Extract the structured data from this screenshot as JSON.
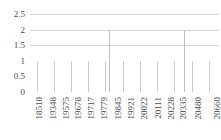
{
  "chart_data": {
    "type": "bar",
    "title": "",
    "subtitle": "",
    "xlabel": "",
    "ylabel": "",
    "ylim": [
      0,
      2.5
    ],
    "grid": true,
    "legend": null,
    "y_ticks": [
      "0",
      "0.5",
      "1",
      "1.5",
      "2",
      "2.5"
    ],
    "y_tick_values": [
      0,
      0.5,
      1,
      1.5,
      2,
      2.5
    ],
    "x_tick_labels": [
      "18510",
      "19348",
      "19575",
      "19678",
      "19717",
      "19779",
      "19845",
      "19921",
      "20022",
      "20111",
      "20228",
      "20335",
      "20480",
      "20660"
    ],
    "x_tick_indices": [
      0,
      7,
      13,
      19,
      25,
      31,
      38,
      44,
      50,
      57,
      63,
      69,
      76,
      85
    ],
    "categories": [
      "18510",
      "18562",
      "18643",
      "18710",
      "18788",
      "18851",
      "18920",
      "19348",
      "19389",
      "19421",
      "19468",
      "19503",
      "19540",
      "19575",
      "19601",
      "19622",
      "19640",
      "19659",
      "19678",
      "19690",
      "19698",
      "19703",
      "19709",
      "19713",
      "19717",
      "19726",
      "19738",
      "19749",
      "19760",
      "19770",
      "19779",
      "19790",
      "19802",
      "19815",
      "19828",
      "19838",
      "19845",
      "19858",
      "19872",
      "19886",
      "19899",
      "19910",
      "19921",
      "19936",
      "19952",
      "19968",
      "19984",
      "20000",
      "20022",
      "20038",
      "20055",
      "20072",
      "20089",
      "20100",
      "20111",
      "20128",
      "20146",
      "20164",
      "20182",
      "20200",
      "20228",
      "20246",
      "20264",
      "20282",
      "20300",
      "20318",
      "20335",
      "20355",
      "20375",
      "20395",
      "20415",
      "20435",
      "20480",
      "20500",
      "20520",
      "20540",
      "20560",
      "20580",
      "20600",
      "20615",
      "20630",
      "20645",
      "20660",
      "20672",
      "20684",
      "20696",
      "20708",
      "20718",
      "20728",
      "20738"
    ],
    "values": [
      1,
      1,
      1,
      1,
      1,
      1,
      1,
      1,
      1,
      1,
      1,
      1,
      1,
      1,
      1,
      1,
      1,
      1,
      1,
      1,
      1,
      1,
      1,
      1,
      1,
      1,
      1,
      1,
      1,
      1,
      1,
      1,
      1,
      1,
      1,
      1,
      1,
      2,
      1,
      1,
      1,
      1,
      1,
      1,
      1,
      1,
      1,
      1,
      1,
      1,
      1,
      1,
      1,
      1,
      1,
      1,
      1,
      1,
      1,
      1,
      1,
      1,
      1,
      1,
      1,
      1,
      1,
      1,
      1,
      1,
      1,
      1,
      1,
      2,
      1,
      1,
      1,
      1,
      1,
      1,
      1,
      1,
      1,
      1,
      1,
      1,
      1,
      1,
      1,
      1
    ],
    "bar_count": 90,
    "spike_indices": [
      37,
      73
    ],
    "spike_value": 2,
    "base_value": 1,
    "colors": {
      "bar": "#cfcfcf",
      "gridline": "#d4d4d4",
      "baseline": "#c0c0c0",
      "text": "#4d4d4d",
      "background": "#ffffff"
    }
  }
}
